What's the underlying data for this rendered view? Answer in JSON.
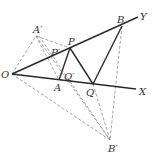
{
  "diagram": {
    "type": "geometry",
    "points": {
      "O": {
        "label": "O",
        "x": 12,
        "y": 74
      },
      "A": {
        "label": "A",
        "x": 59,
        "y": 80
      },
      "Q": {
        "label": "Q",
        "x": 93,
        "y": 84
      },
      "P": {
        "label": "P",
        "x": 70,
        "y": 48
      },
      "B": {
        "label": "B",
        "x": 122,
        "y": 26
      },
      "A_prime": {
        "label": "A′",
        "x": 36,
        "y": 36
      },
      "B_prime": {
        "label": "B′",
        "x": 110,
        "y": 140
      },
      "P_prime": {
        "label": "P′",
        "x": 52,
        "y": 56
      },
      "Q_prime": {
        "label": "Q′",
        "x": 67,
        "y": 78
      }
    },
    "rays": {
      "X": {
        "label": "X",
        "x": 136,
        "y": 89
      },
      "Y": {
        "label": "Y",
        "x": 138,
        "y": 17
      }
    }
  }
}
